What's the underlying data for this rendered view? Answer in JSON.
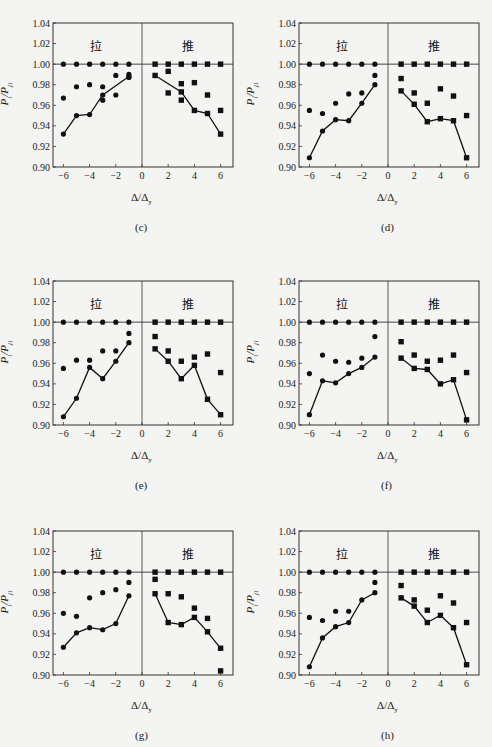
{
  "figure": {
    "y_axis_label": "P_i/P_j1",
    "x_axis_label": "Δ/Δy",
    "side_labels": {
      "pull": "拉",
      "push": "推"
    },
    "yticks": [
      "1.04",
      "1.02",
      "1.00",
      "0.98",
      "0.96",
      "0.94",
      "0.92",
      "0.90"
    ],
    "xticks": [
      "-6",
      "-4",
      "-2",
      "0",
      "2",
      "4",
      "6"
    ]
  },
  "chart_data": [
    {
      "id": "c",
      "caption": "(c)",
      "type": "scatter",
      "xlabel": "Δ/Δy",
      "ylabel": "Pi/Pj1",
      "xlim": [
        -7,
        7
      ],
      "ylim": [
        0.9,
        1.04
      ],
      "reference_line": 1.0,
      "series": [
        {
          "name": "pull_top",
          "marker": "circle",
          "x": [
            -6,
            -5,
            -4,
            -3,
            -2,
            -1
          ],
          "y": [
            1.0,
            1.0,
            1.0,
            1.0,
            1.0,
            1.0
          ]
        },
        {
          "name": "pull_mid",
          "marker": "circle",
          "x": [
            -6,
            -5,
            -4,
            -3,
            -2,
            -1,
            -2,
            -3,
            -1
          ],
          "y": [
            0.967,
            0.978,
            0.98,
            0.978,
            0.989,
            0.99,
            0.97,
            0.965,
            0.987
          ]
        },
        {
          "name": "pull_line",
          "marker": "circle",
          "line": true,
          "x": [
            -6,
            -5,
            -4,
            -3,
            -1
          ],
          "y": [
            0.932,
            0.95,
            0.951,
            0.97,
            0.988
          ]
        },
        {
          "name": "push_top",
          "marker": "square",
          "x": [
            1,
            2,
            3,
            4,
            5,
            6
          ],
          "y": [
            1.0,
            1.0,
            1.0,
            1.0,
            1.0,
            1.0
          ]
        },
        {
          "name": "push_mid",
          "marker": "square",
          "x": [
            2,
            2,
            3,
            3,
            4,
            5,
            6
          ],
          "y": [
            0.993,
            0.972,
            0.981,
            0.965,
            0.982,
            0.97,
            0.955
          ]
        },
        {
          "name": "push_line",
          "marker": "square",
          "line": true,
          "x": [
            1,
            3,
            4,
            5,
            6
          ],
          "y": [
            0.989,
            0.973,
            0.955,
            0.952,
            0.932
          ]
        }
      ]
    },
    {
      "id": "d",
      "caption": "(d)",
      "type": "scatter",
      "xlabel": "Δ/Δy",
      "ylabel": "Pi/Pj1",
      "xlim": [
        -7,
        7
      ],
      "ylim": [
        0.9,
        1.04
      ],
      "reference_line": 1.0,
      "series": [
        {
          "name": "pull_top",
          "marker": "circle",
          "x": [
            -6,
            -5,
            -4,
            -3,
            -2,
            -1
          ],
          "y": [
            1.0,
            1.0,
            1.0,
            1.0,
            1.0,
            1.0
          ]
        },
        {
          "name": "pull_mid",
          "marker": "circle",
          "x": [
            -6,
            -5,
            -4,
            -3,
            -2,
            -1
          ],
          "y": [
            0.955,
            0.952,
            0.962,
            0.971,
            0.972,
            0.989
          ]
        },
        {
          "name": "pull_line",
          "marker": "circle",
          "line": true,
          "x": [
            -6,
            -5,
            -4,
            -3,
            -2,
            -1
          ],
          "y": [
            0.909,
            0.935,
            0.946,
            0.945,
            0.962,
            0.98
          ]
        },
        {
          "name": "push_top",
          "marker": "square",
          "x": [
            1,
            2,
            3,
            4,
            5,
            6
          ],
          "y": [
            1.0,
            1.0,
            1.0,
            1.0,
            1.0,
            1.0
          ]
        },
        {
          "name": "push_mid",
          "marker": "square",
          "x": [
            1,
            2,
            3,
            4,
            5,
            6
          ],
          "y": [
            0.986,
            0.972,
            0.962,
            0.976,
            0.969,
            0.95
          ]
        },
        {
          "name": "push_line",
          "marker": "square",
          "line": true,
          "x": [
            1,
            2,
            3,
            4,
            5,
            6
          ],
          "y": [
            0.974,
            0.961,
            0.944,
            0.947,
            0.945,
            0.909
          ]
        }
      ]
    },
    {
      "id": "e",
      "caption": "(e)",
      "type": "scatter",
      "xlabel": "Δ/Δy",
      "ylabel": "Pi/Pj1",
      "xlim": [
        -7,
        7
      ],
      "ylim": [
        0.9,
        1.04
      ],
      "reference_line": 1.0,
      "series": [
        {
          "name": "pull_top",
          "marker": "circle",
          "x": [
            -6,
            -5,
            -4,
            -3,
            -2,
            -1
          ],
          "y": [
            1.0,
            1.0,
            1.0,
            1.0,
            1.0,
            1.0
          ]
        },
        {
          "name": "pull_mid",
          "marker": "circle",
          "x": [
            -6,
            -5,
            -4,
            -3,
            -2,
            -1
          ],
          "y": [
            0.955,
            0.963,
            0.963,
            0.972,
            0.972,
            0.989
          ]
        },
        {
          "name": "pull_line",
          "marker": "circle",
          "line": true,
          "x": [
            -6,
            -5,
            -4,
            -3,
            -2,
            -1
          ],
          "y": [
            0.908,
            0.926,
            0.956,
            0.945,
            0.962,
            0.98
          ]
        },
        {
          "name": "push_top",
          "marker": "square",
          "x": [
            1,
            2,
            3,
            4,
            5,
            6
          ],
          "y": [
            1.0,
            1.0,
            1.0,
            1.0,
            1.0,
            1.0
          ]
        },
        {
          "name": "push_mid",
          "marker": "square",
          "x": [
            1,
            2,
            3,
            4,
            5,
            6
          ],
          "y": [
            0.986,
            0.972,
            0.962,
            0.966,
            0.969,
            0.951
          ]
        },
        {
          "name": "push_line",
          "marker": "square",
          "line": true,
          "x": [
            1,
            2,
            3,
            4,
            5,
            6
          ],
          "y": [
            0.974,
            0.962,
            0.945,
            0.958,
            0.925,
            0.91
          ]
        }
      ]
    },
    {
      "id": "f",
      "caption": "(f)",
      "type": "scatter",
      "xlabel": "Δ/Δy",
      "ylabel": "Pi/Pj1",
      "xlim": [
        -7,
        7
      ],
      "ylim": [
        0.9,
        1.04
      ],
      "reference_line": 1.0,
      "series": [
        {
          "name": "pull_top",
          "marker": "circle",
          "x": [
            -6,
            -5,
            -4,
            -3,
            -2,
            -1
          ],
          "y": [
            1.0,
            1.0,
            1.0,
            1.0,
            1.0,
            1.0
          ]
        },
        {
          "name": "pull_mid",
          "marker": "circle",
          "x": [
            -6,
            -5,
            -4,
            -3,
            -2,
            -1
          ],
          "y": [
            0.95,
            0.968,
            0.962,
            0.961,
            0.965,
            0.986
          ]
        },
        {
          "name": "pull_line",
          "marker": "circle",
          "line": true,
          "x": [
            -6,
            -5,
            -4,
            -3,
            -2,
            -1
          ],
          "y": [
            0.91,
            0.943,
            0.941,
            0.95,
            0.956,
            0.966
          ]
        },
        {
          "name": "push_top",
          "marker": "square",
          "x": [
            1,
            2,
            3,
            4,
            5,
            6
          ],
          "y": [
            1.0,
            1.0,
            1.0,
            1.0,
            1.0,
            1.0
          ]
        },
        {
          "name": "push_mid",
          "marker": "square",
          "x": [
            1,
            2,
            3,
            4,
            5,
            6
          ],
          "y": [
            0.981,
            0.968,
            0.962,
            0.963,
            0.968,
            0.951
          ]
        },
        {
          "name": "push_line",
          "marker": "square",
          "line": true,
          "x": [
            1,
            2,
            3,
            4,
            5,
            6
          ],
          "y": [
            0.965,
            0.955,
            0.954,
            0.94,
            0.944,
            0.905
          ]
        }
      ]
    },
    {
      "id": "g",
      "caption": "(g)",
      "type": "scatter",
      "xlabel": "Δ/Δy",
      "ylabel": "Pi/Pj1",
      "xlim": [
        -7,
        7
      ],
      "ylim": [
        0.9,
        1.04
      ],
      "reference_line": 1.0,
      "series": [
        {
          "name": "pull_top",
          "marker": "circle",
          "x": [
            -6,
            -5,
            -4,
            -3,
            -2,
            -1
          ],
          "y": [
            1.0,
            1.0,
            1.0,
            1.0,
            1.0,
            1.0
          ]
        },
        {
          "name": "pull_mid",
          "marker": "circle",
          "x": [
            -6,
            -5,
            -4,
            -3,
            -2,
            -1
          ],
          "y": [
            0.96,
            0.957,
            0.975,
            0.98,
            0.983,
            0.99
          ]
        },
        {
          "name": "pull_line",
          "marker": "circle",
          "line": true,
          "x": [
            -6,
            -5,
            -4,
            -3,
            -2,
            -1
          ],
          "y": [
            0.927,
            0.941,
            0.946,
            0.944,
            0.95,
            0.977
          ]
        },
        {
          "name": "push_top",
          "marker": "square",
          "x": [
            1,
            2,
            3,
            4,
            5,
            6
          ],
          "y": [
            1.0,
            1.0,
            1.0,
            1.0,
            1.0,
            1.0
          ]
        },
        {
          "name": "push_mid",
          "marker": "square",
          "x": [
            1,
            2,
            3,
            4,
            5,
            6
          ],
          "y": [
            0.993,
            0.979,
            0.976,
            0.965,
            0.955,
            0.904
          ]
        },
        {
          "name": "push_line",
          "marker": "square",
          "line": true,
          "x": [
            1,
            2,
            3,
            4,
            5,
            6
          ],
          "y": [
            0.979,
            0.951,
            0.949,
            0.956,
            0.942,
            0.926
          ]
        }
      ]
    },
    {
      "id": "h",
      "caption": "(h)",
      "type": "scatter",
      "xlabel": "Δ/Δy",
      "ylabel": "Pi/Pj1",
      "xlim": [
        -7,
        7
      ],
      "ylim": [
        0.9,
        1.04
      ],
      "reference_line": 1.0,
      "series": [
        {
          "name": "pull_top",
          "marker": "circle",
          "x": [
            -6,
            -5,
            -4,
            -3,
            -2,
            -1
          ],
          "y": [
            1.0,
            1.0,
            1.0,
            1.0,
            1.0,
            1.0
          ]
        },
        {
          "name": "pull_mid",
          "marker": "circle",
          "x": [
            -6,
            -5,
            -4,
            -3,
            -1
          ],
          "y": [
            0.956,
            0.953,
            0.962,
            0.962,
            0.99
          ]
        },
        {
          "name": "pull_line",
          "marker": "circle",
          "line": true,
          "x": [
            -6,
            -5,
            -4,
            -3,
            -2,
            -1
          ],
          "y": [
            0.908,
            0.936,
            0.947,
            0.951,
            0.973,
            0.98
          ]
        },
        {
          "name": "push_top",
          "marker": "square",
          "x": [
            1,
            2,
            3,
            4,
            5,
            6
          ],
          "y": [
            1.0,
            1.0,
            1.0,
            1.0,
            1.0,
            1.0
          ]
        },
        {
          "name": "push_mid",
          "marker": "square",
          "x": [
            1,
            2,
            3,
            4,
            5,
            6
          ],
          "y": [
            0.987,
            0.973,
            0.963,
            0.977,
            0.97,
            0.951
          ]
        },
        {
          "name": "push_line",
          "marker": "square",
          "line": true,
          "x": [
            1,
            2,
            3,
            4,
            5,
            6
          ],
          "y": [
            0.975,
            0.967,
            0.951,
            0.958,
            0.946,
            0.91
          ]
        }
      ]
    }
  ]
}
